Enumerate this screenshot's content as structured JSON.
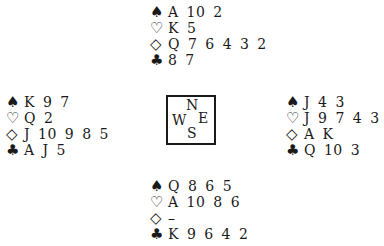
{
  "symbols": {
    "spades": "♠",
    "hearts": "♡",
    "diamonds": "◇",
    "clubs": "♣"
  },
  "hands": {
    "north": {
      "spades": "A 10 2",
      "hearts": "K 5",
      "diamonds": "Q 7 6 4 3 2",
      "clubs": "8 7"
    },
    "west": {
      "spades": "K 9 7",
      "hearts": "Q 2",
      "diamonds": "J 10 9 8 5",
      "clubs": "A J 5"
    },
    "east": {
      "spades": "J 4 3",
      "hearts": "J 9 7 4 3",
      "diamonds": "A K",
      "clubs": "Q 10 3"
    },
    "south": {
      "spades": "Q 8 6 5",
      "hearts": "A 10 8 6",
      "diamonds": "–",
      "clubs": "K 9 6 4 2"
    }
  },
  "compass": {
    "n": "N",
    "w": "W",
    "e": "E",
    "s": "S"
  }
}
